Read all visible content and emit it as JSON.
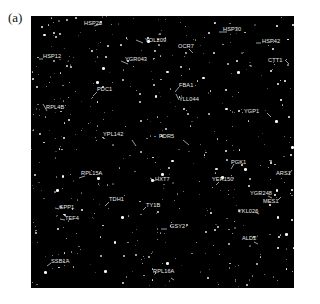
{
  "figure": {
    "panel_label": "(a)",
    "background_color": "#000000",
    "label_color": "#e8e8e8"
  },
  "genes": [
    {
      "name": "HSP26",
      "x": 53,
      "y": 8
    },
    {
      "name": "YOL209",
      "x": 114,
      "y": 25
    },
    {
      "name": "HSP30",
      "x": 192,
      "y": 14
    },
    {
      "name": "HSP12",
      "x": 12,
      "y": 41
    },
    {
      "name": "YGR043",
      "x": 94,
      "y": 44
    },
    {
      "name": "OCR7",
      "x": 147,
      "y": 31
    },
    {
      "name": "HSP42",
      "x": 231,
      "y": 26
    },
    {
      "name": "CTT1",
      "x": 237,
      "y": 45
    },
    {
      "name": "PDC1",
      "x": 66,
      "y": 74
    },
    {
      "name": "RPL4B",
      "x": 15,
      "y": 92
    },
    {
      "name": "FBA1",
      "x": 148,
      "y": 70
    },
    {
      "name": "YLL044",
      "x": 148,
      "y": 84
    },
    {
      "name": "YGP1",
      "x": 213,
      "y": 96
    },
    {
      "name": "YPL142",
      "x": 72,
      "y": 119
    },
    {
      "name": "PDR5",
      "x": 128,
      "y": 121
    },
    {
      "name": "PGK1",
      "x": 200,
      "y": 147
    },
    {
      "name": "RPL15A",
      "x": 50,
      "y": 158
    },
    {
      "name": "HXT7",
      "x": 124,
      "y": 164
    },
    {
      "name": "YER150",
      "x": 181,
      "y": 164
    },
    {
      "name": "ARS1",
      "x": 245,
      "y": 158
    },
    {
      "name": "YGR248",
      "x": 219,
      "y": 178
    },
    {
      "name": "MES1",
      "x": 232,
      "y": 186
    },
    {
      "name": "TDH1",
      "x": 78,
      "y": 184
    },
    {
      "name": "TY1B",
      "x": 115,
      "y": 190
    },
    {
      "name": "YKL026",
      "x": 207,
      "y": 196
    },
    {
      "name": "GPP1",
      "x": 28,
      "y": 192
    },
    {
      "name": "TEF4",
      "x": 34,
      "y": 203
    },
    {
      "name": "GSY2",
      "x": 139,
      "y": 211
    },
    {
      "name": "ALD2",
      "x": 211,
      "y": 223
    },
    {
      "name": "SSB1A",
      "x": 20,
      "y": 246
    },
    {
      "name": "RPL16A",
      "x": 122,
      "y": 256
    }
  ],
  "leaders": [
    [
      63,
      10,
      70,
      8
    ],
    [
      105,
      24,
      112,
      27
    ],
    [
      188,
      16,
      196,
      16
    ],
    [
      8,
      43,
      12,
      43
    ],
    [
      90,
      45,
      97,
      48
    ],
    [
      158,
      33,
      162,
      37
    ],
    [
      225,
      27,
      230,
      27
    ],
    [
      254,
      44,
      258,
      48
    ],
    [
      62,
      80,
      66,
      76
    ],
    [
      12,
      88,
      16,
      95
    ],
    [
      144,
      76,
      148,
      71
    ],
    [
      145,
      78,
      148,
      84
    ],
    [
      236,
      97,
      240,
      101
    ],
    [
      101,
      124,
      105,
      130
    ],
    [
      152,
      124,
      158,
      129
    ],
    [
      200,
      153,
      203,
      148
    ],
    [
      48,
      162,
      54,
      160
    ],
    [
      119,
      162,
      124,
      165
    ],
    [
      185,
      169,
      188,
      166
    ],
    [
      258,
      158,
      261,
      154
    ],
    [
      237,
      180,
      241,
      182
    ],
    [
      247,
      184,
      250,
      181
    ],
    [
      74,
      190,
      78,
      186
    ],
    [
      112,
      194,
      115,
      191
    ],
    [
      224,
      196,
      228,
      198
    ],
    [
      24,
      192,
      28,
      193
    ],
    [
      29,
      203,
      34,
      204
    ],
    [
      130,
      213,
      136,
      213
    ],
    [
      223,
      226,
      227,
      228
    ],
    [
      16,
      250,
      20,
      247
    ],
    [
      140,
      262,
      143,
      264
    ]
  ]
}
